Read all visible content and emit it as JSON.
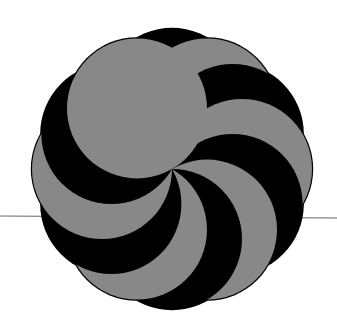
{
  "figure": {
    "type": "pinwheel-swirl",
    "center": [
      172,
      169
    ],
    "circle_radius": 70,
    "circle_count": 12,
    "colors": {
      "dark": "#000000",
      "light": "#888888",
      "outline": "#000000",
      "line": "#666666",
      "background": "#ffffff"
    },
    "horizon_line": {
      "x1": 0,
      "y1": 216,
      "x2": 337,
      "y2": 218
    }
  }
}
